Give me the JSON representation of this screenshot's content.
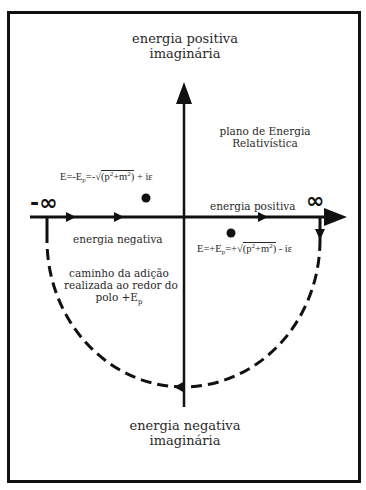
{
  "diagram": {
    "title_top": {
      "line1": "energia positiva",
      "line2": "imaginária"
    },
    "title_bottom": {
      "line1": "energia negativa",
      "line2": "imaginária"
    },
    "plane_label": {
      "line1": "plano de Energia",
      "line2": "Relativística"
    },
    "axis_labels": {
      "positive_energy": "energia positiva",
      "negative_energy": "energia negativa",
      "minus_infinity": "-∞",
      "plus_infinity": "∞"
    },
    "contour_label": {
      "line1": "caminho da adição",
      "line2": "realizada ao redor do",
      "line3_prefix": "polo +E",
      "line3_sub": "p"
    },
    "poles": [
      {
        "name": "negative-energy-pole",
        "formula": {
          "prefix": "E=-E",
          "sub": "p",
          "middle": "=-√",
          "radicand_open": "(p",
          "sup1": "2",
          "plus": "+m",
          "sup2": "2",
          "radicand_close": ")",
          "suffix": " + iε"
        }
      },
      {
        "name": "positive-energy-pole",
        "formula": {
          "prefix": "E=+E",
          "sub": "p",
          "middle": "=+√",
          "radicand_open": "(p",
          "sup1": "2",
          "plus": "+m",
          "sup2": "2",
          "radicand_close": ")",
          "suffix": " - iε"
        }
      }
    ],
    "colors": {
      "ink": "#111111",
      "text": "#2a2a2a",
      "background": "#ffffff"
    }
  }
}
